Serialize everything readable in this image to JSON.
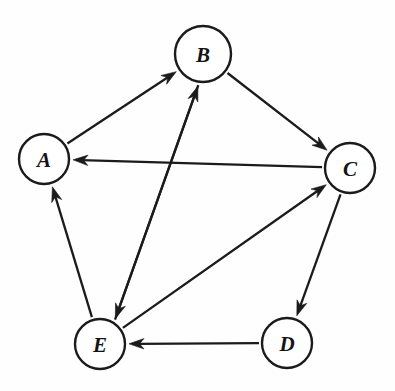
{
  "diagram": {
    "type": "directed-graph",
    "background_color": "#fefefe",
    "stroke_color": "#1b1b1b",
    "node_fill_color": "#ffffff",
    "canvas": {
      "width": 395,
      "height": 391
    },
    "nodes": [
      {
        "id": "A",
        "label": "A",
        "cx": 44,
        "cy": 159,
        "r": 25
      },
      {
        "id": "B",
        "label": "B",
        "cx": 203,
        "cy": 54,
        "r": 28
      },
      {
        "id": "C",
        "label": "C",
        "cx": 350,
        "cy": 168,
        "r": 25
      },
      {
        "id": "D",
        "label": "D",
        "cx": 287,
        "cy": 343,
        "r": 25
      },
      {
        "id": "E",
        "label": "E",
        "cx": 100,
        "cy": 344,
        "r": 25
      }
    ],
    "edges": [
      {
        "id": "A-B",
        "from": "A",
        "to": "B",
        "directed": true,
        "offset": 0
      },
      {
        "id": "B-C",
        "from": "B",
        "to": "C",
        "directed": true,
        "offset": 0
      },
      {
        "id": "C-A",
        "from": "C",
        "to": "A",
        "directed": true,
        "offset": 0
      },
      {
        "id": "C-D",
        "from": "C",
        "to": "D",
        "directed": true,
        "offset": 0
      },
      {
        "id": "D-E",
        "from": "D",
        "to": "E",
        "directed": true,
        "offset": 0
      },
      {
        "id": "E-A",
        "from": "E",
        "to": "A",
        "directed": true,
        "offset": 0
      },
      {
        "id": "E-C",
        "from": "E",
        "to": "C",
        "directed": true,
        "offset": 0
      },
      {
        "id": "B-E",
        "from": "B",
        "to": "E",
        "directed": true,
        "offset": -6
      },
      {
        "id": "E-B",
        "from": "E",
        "to": "B",
        "directed": true,
        "offset": 6
      }
    ],
    "edge_count": 9,
    "node_count": 5
  }
}
